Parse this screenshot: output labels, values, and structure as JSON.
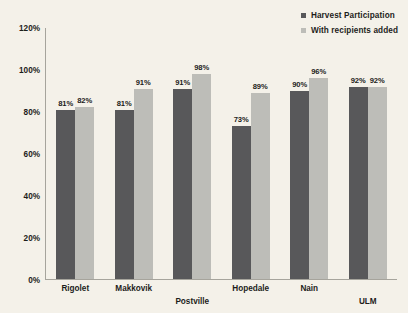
{
  "chart_data": {
    "type": "bar",
    "title": "",
    "xlabel": "",
    "ylabel": "",
    "ylim": [
      0,
      120
    ],
    "yticks": [
      "0%",
      "20%",
      "40%",
      "60%",
      "80%",
      "100%",
      "120%"
    ],
    "ytick_values": [
      0,
      20,
      40,
      60,
      80,
      100,
      120
    ],
    "grid": false,
    "legend_position": "top-right",
    "categories": [
      "Rigolet",
      "Makkovik",
      "Postville",
      "Hopedale",
      "Nain",
      "ULM"
    ],
    "category_label_rows": [
      0,
      0,
      1,
      0,
      0,
      1
    ],
    "series": [
      {
        "name": "Harvest Participation",
        "color": "#58585a",
        "values": [
          81,
          81,
          91,
          73,
          90,
          92
        ],
        "labels": [
          "81%",
          "81%",
          "91%",
          "73%",
          "90%",
          "92%"
        ]
      },
      {
        "name": "With recipients added",
        "color": "#bdbdb8",
        "values": [
          82,
          91,
          98,
          89,
          96,
          92
        ],
        "labels": [
          "82%",
          "91%",
          "98%",
          "89%",
          "96%",
          "92%"
        ]
      }
    ]
  },
  "colors": {
    "background": "#f4f1e9",
    "axis": "#a6a49c",
    "text": "#1d1d1b",
    "series_dark": "#58585a",
    "series_light": "#bdbdb8"
  }
}
